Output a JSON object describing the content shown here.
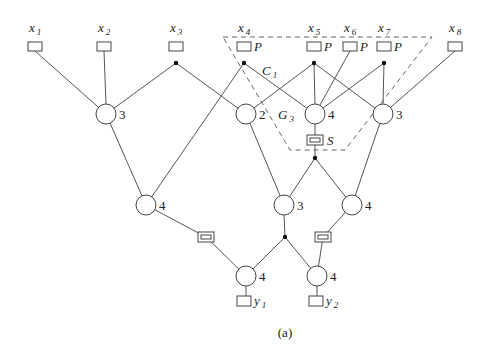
{
  "caption": "(a)",
  "inputs": [
    {
      "id": "x1",
      "base": "x",
      "sub": "1",
      "x": 35,
      "y": 46,
      "tag": ""
    },
    {
      "id": "x2",
      "base": "x",
      "sub": "2",
      "x": 104,
      "y": 46,
      "tag": ""
    },
    {
      "id": "x3",
      "base": "x",
      "sub": "3",
      "x": 176,
      "y": 46,
      "tag": ""
    },
    {
      "id": "x4",
      "base": "x",
      "sub": "4",
      "x": 244,
      "y": 46,
      "tag": "P"
    },
    {
      "id": "x5",
      "base": "x",
      "sub": "5",
      "x": 314,
      "y": 46,
      "tag": "P"
    },
    {
      "id": "x6",
      "base": "x",
      "sub": "6",
      "x": 350,
      "y": 46,
      "tag": "P"
    },
    {
      "id": "x7",
      "base": "x",
      "sub": "7",
      "x": 384,
      "y": 46,
      "tag": "P"
    },
    {
      "id": "x8",
      "base": "x",
      "sub": "8",
      "x": 455,
      "y": 46,
      "tag": ""
    }
  ],
  "gates": [
    {
      "id": "g1",
      "x": 106,
      "y": 114,
      "label": "3"
    },
    {
      "id": "g2",
      "x": 246,
      "y": 114,
      "label": "2"
    },
    {
      "id": "g3",
      "x": 315,
      "y": 114,
      "label": "4",
      "name": "G",
      "name_sub": "3"
    },
    {
      "id": "g4",
      "x": 383,
      "y": 114,
      "label": "3"
    },
    {
      "id": "g5",
      "x": 146,
      "y": 205,
      "label": "4"
    },
    {
      "id": "g6",
      "x": 284,
      "y": 205,
      "label": "3"
    },
    {
      "id": "g7",
      "x": 352,
      "y": 205,
      "label": "4"
    },
    {
      "id": "g8",
      "x": 246,
      "y": 276,
      "label": "4"
    },
    {
      "id": "g9",
      "x": 317,
      "y": 276,
      "label": "4"
    }
  ],
  "outputs": [
    {
      "id": "y1",
      "base": "y",
      "sub": "1",
      "x": 244,
      "y": 301
    },
    {
      "id": "y2",
      "base": "y",
      "sub": "2",
      "x": 316,
      "y": 301
    }
  ],
  "delay_boxes": [
    {
      "id": "S",
      "x": 315,
      "y": 140,
      "label": "S"
    },
    {
      "id": "d1",
      "x": 206,
      "y": 237,
      "label": ""
    },
    {
      "id": "d2",
      "x": 323,
      "y": 237,
      "label": ""
    }
  ],
  "fanout_dots": [
    {
      "x": 176,
      "y": 63
    },
    {
      "x": 244,
      "y": 63
    },
    {
      "x": 314,
      "y": 63
    },
    {
      "x": 384,
      "y": 63
    },
    {
      "x": 315,
      "y": 158
    },
    {
      "x": 285,
      "y": 237
    }
  ],
  "region": {
    "label": "C",
    "label_sub": "1",
    "points": "223,37 432,37 345,150 290,150"
  },
  "edges": [
    [
      35,
      51,
      106,
      114
    ],
    [
      104,
      51,
      106,
      104
    ],
    [
      176,
      63,
      106,
      114
    ],
    [
      176,
      63,
      246,
      114
    ],
    [
      244,
      63,
      146,
      205
    ],
    [
      244,
      63,
      315,
      114
    ],
    [
      314,
      63,
      246,
      114
    ],
    [
      314,
      63,
      315,
      104
    ],
    [
      314,
      63,
      383,
      114
    ],
    [
      350,
      51,
      315,
      114
    ],
    [
      384,
      63,
      315,
      114
    ],
    [
      384,
      63,
      383,
      104
    ],
    [
      455,
      51,
      383,
      114
    ],
    [
      106,
      114,
      146,
      205
    ],
    [
      246,
      114,
      284,
      205
    ],
    [
      383,
      114,
      352,
      205
    ],
    [
      315,
      124,
      315,
      135
    ],
    [
      315,
      145,
      315,
      158
    ],
    [
      315,
      158,
      284,
      205
    ],
    [
      315,
      158,
      352,
      205
    ],
    [
      146,
      205,
      206,
      237
    ],
    [
      206,
      237,
      246,
      276
    ],
    [
      284,
      215,
      285,
      237
    ],
    [
      285,
      237,
      246,
      276
    ],
    [
      285,
      237,
      317,
      276
    ],
    [
      352,
      205,
      323,
      237
    ],
    [
      323,
      237,
      317,
      276
    ],
    [
      246,
      286,
      246,
      296
    ],
    [
      317,
      286,
      317,
      296
    ]
  ]
}
